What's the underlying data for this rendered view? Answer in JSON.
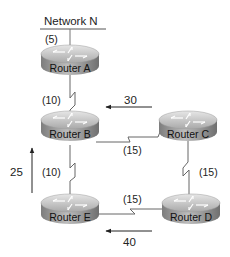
{
  "network": {
    "label": "Network N",
    "cost": "(5)"
  },
  "routers": [
    {
      "id": "A",
      "label": "Router A"
    },
    {
      "id": "B",
      "label": "Router B"
    },
    {
      "id": "C",
      "label": "Router C"
    },
    {
      "id": "D",
      "label": "Router D"
    },
    {
      "id": "E",
      "label": "Router E"
    }
  ],
  "links": [
    {
      "from": "A",
      "to": "B",
      "cost": "(10)"
    },
    {
      "from": "B",
      "to": "C",
      "cost": "(15)"
    },
    {
      "from": "C",
      "to": "D",
      "cost": "(15)"
    },
    {
      "from": "D",
      "to": "E",
      "cost": "(15)"
    },
    {
      "from": "B",
      "to": "E",
      "cost": "(10)"
    }
  ],
  "flows": [
    {
      "label": "30",
      "direction": "left"
    },
    {
      "label": "25",
      "direction": "up"
    },
    {
      "label": "40",
      "direction": "left"
    }
  ],
  "colors": {
    "router_top": "#c8c8c8",
    "router_side": "#8a8a8a",
    "line": "#555555"
  }
}
